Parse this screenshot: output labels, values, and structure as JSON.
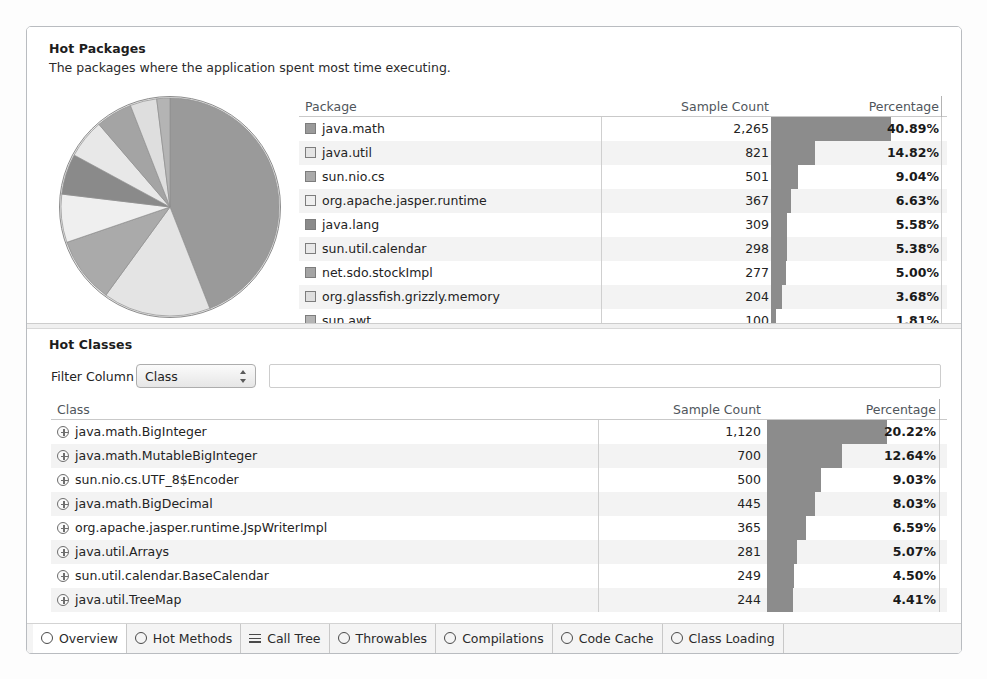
{
  "hot_packages": {
    "title": "Hot Packages",
    "subtitle": "The packages where the application spent most time executing.",
    "columns": {
      "name": "Package",
      "count": "Sample Count",
      "percentage": "Percentage"
    },
    "rows": [
      {
        "name": "java.math",
        "count": "2,265",
        "percentage": "40.89%",
        "pct_value": 40.89,
        "swatch": "#9a9a9a"
      },
      {
        "name": "java.util",
        "count": "821",
        "percentage": "14.82%",
        "pct_value": 14.82,
        "swatch": "#e4e4e4"
      },
      {
        "name": "sun.nio.cs",
        "count": "501",
        "percentage": "9.04%",
        "pct_value": 9.04,
        "swatch": "#aaaaaa"
      },
      {
        "name": "org.apache.jasper.runtime",
        "count": "367",
        "percentage": "6.63%",
        "pct_value": 6.63,
        "swatch": "#efefef"
      },
      {
        "name": "java.lang",
        "count": "309",
        "percentage": "5.58%",
        "pct_value": 5.58,
        "swatch": "#8a8a8a"
      },
      {
        "name": "sun.util.calendar",
        "count": "298",
        "percentage": "5.38%",
        "pct_value": 5.38,
        "swatch": "#e8e8e8"
      },
      {
        "name": "net.sdo.stockImpl",
        "count": "277",
        "percentage": "5.00%",
        "pct_value": 5.0,
        "swatch": "#a4a4a4"
      },
      {
        "name": "org.glassfish.grizzly.memory",
        "count": "204",
        "percentage": "3.68%",
        "pct_value": 3.68,
        "swatch": "#dedede"
      },
      {
        "name": "sun.awt",
        "count": "100",
        "percentage": "1.81%",
        "pct_value": 1.81,
        "swatch": "#b4b4b4"
      }
    ]
  },
  "hot_classes": {
    "title": "Hot Classes",
    "filter_label": "Filter Column",
    "filter_value": "Class",
    "filter_options": [
      "Class",
      "Sample Count",
      "Percentage"
    ],
    "search_value": "",
    "search_placeholder": "",
    "columns": {
      "name": "Class",
      "count": "Sample Count",
      "percentage": "Percentage"
    },
    "rows": [
      {
        "name": "java.math.BigInteger",
        "count": "1,120",
        "percentage": "20.22%",
        "pct_value": 20.22
      },
      {
        "name": "java.math.MutableBigInteger",
        "count": "700",
        "percentage": "12.64%",
        "pct_value": 12.64
      },
      {
        "name": "sun.nio.cs.UTF_8$Encoder",
        "count": "500",
        "percentage": "9.03%",
        "pct_value": 9.03
      },
      {
        "name": "java.math.BigDecimal",
        "count": "445",
        "percentage": "8.03%",
        "pct_value": 8.03
      },
      {
        "name": "org.apache.jasper.runtime.JspWriterImpl",
        "count": "365",
        "percentage": "6.59%",
        "pct_value": 6.59
      },
      {
        "name": "java.util.Arrays",
        "count": "281",
        "percentage": "5.07%",
        "pct_value": 5.07
      },
      {
        "name": "sun.util.calendar.BaseCalendar",
        "count": "249",
        "percentage": "4.50%",
        "pct_value": 4.5
      },
      {
        "name": "java.util.TreeMap",
        "count": "244",
        "percentage": "4.41%",
        "pct_value": 4.41
      }
    ]
  },
  "tabs": [
    {
      "label": "Overview",
      "icon": "overview-icon",
      "selected": true
    },
    {
      "label": "Hot Methods",
      "icon": "hot-methods-icon",
      "selected": false
    },
    {
      "label": "Call Tree",
      "icon": "call-tree-icon",
      "selected": false
    },
    {
      "label": "Throwables",
      "icon": "throwables-icon",
      "selected": false
    },
    {
      "label": "Compilations",
      "icon": "compilations-icon",
      "selected": false
    },
    {
      "label": "Code Cache",
      "icon": "code-cache-icon",
      "selected": false
    },
    {
      "label": "Class Loading",
      "icon": "class-loading-icon",
      "selected": false
    }
  ],
  "chart_data": {
    "type": "pie",
    "title": "Hot Packages",
    "labels": [
      "java.math",
      "java.util",
      "sun.nio.cs",
      "org.apache.jasper.runtime",
      "java.lang",
      "sun.util.calendar",
      "net.sdo.stockImpl",
      "org.glassfish.grizzly.memory",
      "sun.awt"
    ],
    "values": [
      40.89,
      14.82,
      9.04,
      6.63,
      5.58,
      5.38,
      5.0,
      3.68,
      1.81
    ],
    "units": "percent",
    "sample_counts": [
      2265,
      821,
      501,
      367,
      309,
      298,
      277,
      204,
      100
    ],
    "colors": [
      "#9a9a9a",
      "#e4e4e4",
      "#aaaaaa",
      "#efefef",
      "#8a8a8a",
      "#e8e8e8",
      "#a4a4a4",
      "#dedede",
      "#b4b4b4"
    ],
    "legend": "right",
    "grid": false
  },
  "colors": {
    "bar": "#8c8c8c",
    "frame_border": "#b9bcc0",
    "row_alt": "#f3f3f3",
    "header_text": "#50565c"
  }
}
